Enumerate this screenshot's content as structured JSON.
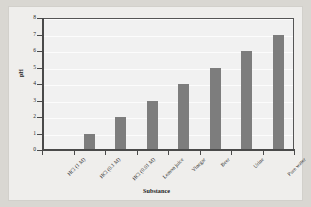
{
  "chart_data": {
    "type": "bar",
    "title": "",
    "xlabel": "Substance",
    "ylabel": "pH",
    "categories": [
      "HCl (1 M)",
      "HCl (0.1 M)",
      "HCl (0.01 M)",
      "Lemon juice",
      "Vinegar",
      "Beer",
      "Urine",
      "Pure water"
    ],
    "values": [
      0,
      1,
      2,
      3,
      4,
      5,
      6,
      7
    ],
    "ylim": [
      0,
      8
    ],
    "ytick_labels": [
      "0",
      "1",
      "2",
      "3",
      "4",
      "5",
      "6",
      "7",
      "8"
    ],
    "yticks": [
      0,
      1,
      2,
      3,
      4,
      5,
      6,
      7,
      8
    ],
    "grid": "horizontal",
    "legend": "none",
    "colors": {
      "bar": "#7d7d7d",
      "plot_background": "#f1f1f1",
      "gridline": "#fcfcfc",
      "axis": "#4a4a4a",
      "figure_background": "#efeeec",
      "page_background": "#d9d7d2",
      "text": "#2b2b2b"
    }
  }
}
